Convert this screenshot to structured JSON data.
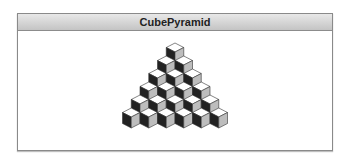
{
  "window": {
    "title": "CubePyramid"
  },
  "pyramid": {
    "rows": 6,
    "cubes_per_row": [
      1,
      2,
      3,
      4,
      5,
      6
    ],
    "colors": {
      "top": "#ffffff",
      "left": "#222222",
      "right": "#bdbdbd",
      "edge": "#333333"
    }
  }
}
